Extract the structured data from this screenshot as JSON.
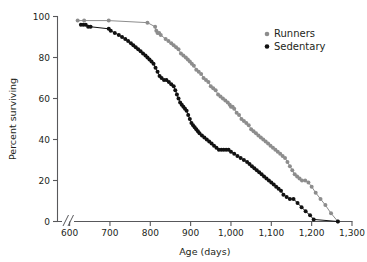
{
  "chart_data": {
    "type": "line",
    "title": "",
    "xlabel": "Age (days)",
    "ylabel": "Percent surviving",
    "xlim": [
      570,
      1300
    ],
    "ylim": [
      0,
      100
    ],
    "xticks": [
      600,
      700,
      800,
      900,
      1000,
      1100,
      1200,
      1300
    ],
    "xticklabels": [
      "600",
      "700",
      "800",
      "900",
      "1,000",
      "1,100",
      "1,200",
      "1,300"
    ],
    "yticks": [
      0,
      20,
      40,
      60,
      80,
      100
    ],
    "yticklabels": [
      "0",
      "20",
      "40",
      "60",
      "80",
      "100"
    ],
    "grid": false,
    "axis_break": "//",
    "legend_position": "top-right",
    "series": [
      {
        "name": "Runners",
        "color": "#8d8d8d",
        "marker": "circle",
        "x": [
          620,
          636,
          697,
          793,
          812,
          815,
          818,
          822,
          826,
          838,
          845,
          852,
          858,
          864,
          870,
          876,
          882,
          888,
          893,
          898,
          903,
          908,
          914,
          920,
          926,
          932,
          938,
          944,
          950,
          956,
          962,
          968,
          974,
          980,
          986,
          992,
          997,
          1000,
          1004,
          1008,
          1014,
          1020,
          1026,
          1032,
          1038,
          1044,
          1050,
          1056,
          1062,
          1068,
          1074,
          1080,
          1086,
          1092,
          1098,
          1104,
          1110,
          1116,
          1122,
          1128,
          1134,
          1140,
          1146,
          1152,
          1158,
          1164,
          1170,
          1176,
          1184,
          1192,
          1200,
          1210,
          1222,
          1234,
          1248,
          1265
        ],
        "y": [
          98,
          98,
          98,
          97,
          95,
          93,
          92,
          92,
          91,
          89,
          88,
          87,
          86,
          85,
          84,
          82,
          81,
          80,
          79,
          78,
          77,
          76,
          74,
          73,
          72,
          70,
          69,
          68,
          66,
          65,
          64,
          62,
          61,
          60,
          59,
          58,
          57,
          56,
          56,
          55,
          53,
          52,
          50,
          49,
          48,
          47,
          45,
          44,
          43,
          42,
          41,
          40,
          39,
          38,
          37,
          36,
          35,
          34,
          33,
          32,
          31,
          29,
          27,
          25,
          23,
          22,
          21,
          20,
          20,
          19,
          17,
          14,
          11,
          8,
          4,
          0
        ]
      },
      {
        "name": "Sedentary",
        "color": "#111111",
        "marker": "circle",
        "x": [
          628,
          634,
          640,
          646,
          652,
          697,
          702,
          712,
          722,
          730,
          738,
          745,
          752,
          758,
          764,
          770,
          776,
          782,
          788,
          793,
          798,
          803,
          808,
          813,
          818,
          823,
          828,
          834,
          840,
          846,
          852,
          858,
          862,
          866,
          870,
          874,
          878,
          882,
          886,
          890,
          894,
          898,
          902,
          906,
          910,
          914,
          918,
          922,
          928,
          934,
          940,
          946,
          952,
          958,
          964,
          970,
          976,
          982,
          988,
          994,
          1000,
          1008,
          1016,
          1024,
          1032,
          1040,
          1046,
          1052,
          1058,
          1064,
          1070,
          1076,
          1082,
          1088,
          1094,
          1100,
          1106,
          1112,
          1118,
          1124,
          1130,
          1138,
          1146,
          1155,
          1165,
          1175,
          1185,
          1196,
          1205,
          1265
        ],
        "y": [
          96,
          96,
          96,
          95,
          95,
          94,
          93,
          92,
          91,
          90,
          89,
          88,
          87,
          86,
          85,
          84,
          83,
          82,
          81,
          80,
          79,
          78,
          77,
          75,
          73,
          71,
          70,
          69,
          69,
          68,
          67,
          66,
          64,
          62,
          60,
          58,
          57,
          56,
          55,
          54,
          52,
          50,
          48,
          47,
          46,
          45,
          44,
          43,
          42,
          41,
          40,
          39,
          38,
          37,
          36,
          35,
          35,
          35,
          35,
          35,
          34,
          33,
          32,
          31,
          30,
          29,
          28,
          27,
          26,
          25,
          24,
          23,
          22,
          21,
          20,
          19,
          18,
          17,
          16,
          15,
          13,
          12,
          11,
          11,
          9,
          7,
          5,
          3,
          1,
          0
        ]
      }
    ]
  },
  "legend": {
    "items": [
      {
        "label": "Runners",
        "color": "#8d8d8d"
      },
      {
        "label": "Sedentary",
        "color": "#111111"
      }
    ]
  }
}
